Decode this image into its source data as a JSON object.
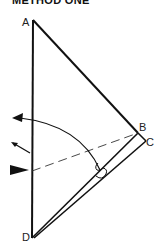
{
  "title": "METHOD ONE",
  "points": {
    "A": {
      "label": "A"
    },
    "B": {
      "label": "B"
    },
    "C": {
      "label": "C"
    },
    "D": {
      "label": "D"
    }
  },
  "colors": {
    "stroke": "#111111",
    "background": "#ffffff"
  }
}
